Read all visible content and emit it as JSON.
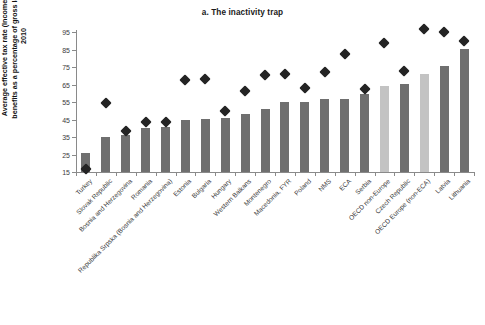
{
  "chart_data": {
    "type": "bar",
    "title": "a. The inactivity trap",
    "xlabel": "",
    "ylabel": "Average effective tax rate (Income tax plus lost benefits as a percentage of gross labor income), 2010",
    "ylim": [
      15,
      95
    ],
    "yticks": [
      15,
      25,
      35,
      45,
      55,
      65,
      75,
      85,
      95
    ],
    "grid": false,
    "legend": "none",
    "categories": [
      "Turkey",
      "Slovak Republic",
      "Bosnia and Herzegovina",
      "Romania",
      "Republika Srpska (Bosnia and Herzegovina)",
      "Estonia",
      "Bulgaria",
      "Hungary",
      "Western Balkans",
      "Montenegro",
      "Macedonia, FYR",
      "Poland",
      "NMS",
      "ECA",
      "Serbia",
      "OECD non-Europe",
      "Czech Republic",
      "OECD Europe (non-ECA)",
      "Latvia",
      "Lithuania"
    ],
    "series": [
      {
        "name": "bars",
        "marker": "bar",
        "values": [
          26,
          35,
          36,
          40,
          40.5,
          45,
          45.5,
          46,
          48,
          51,
          55,
          55,
          56.5,
          57,
          59.5,
          64,
          65.5,
          71,
          75.5,
          85.5
        ]
      },
      {
        "name": "diamonds",
        "marker": "diamond",
        "values": [
          19,
          57,
          41,
          46,
          46,
          70,
          70.5,
          52,
          63.5,
          72.5,
          73.5,
          65.5,
          74.5,
          85,
          65,
          91,
          75,
          99,
          97.5,
          92
        ]
      }
    ],
    "bar_styles": [
      "dark",
      "dark",
      "dark",
      "dark",
      "dark",
      "dark",
      "dark",
      "dark",
      "dark",
      "dark",
      "dark",
      "dark",
      "dark",
      "dark",
      "dark",
      "light",
      "dark",
      "light",
      "dark",
      "dark"
    ],
    "colors": {
      "bar_dark": "#6f6f6f",
      "bar_light": "#c3c3c3",
      "marker": "#242424",
      "axis": "#8a8a8a",
      "text": "#3a3a3a",
      "background": "#ffffff"
    }
  }
}
